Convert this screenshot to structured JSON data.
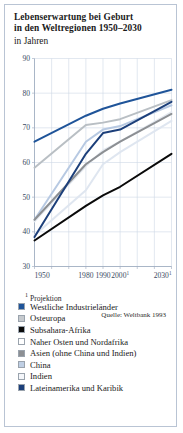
{
  "title": {
    "line1": "Lebenserwartung bei Geburt",
    "line2": "in den Weltregionen 1950–2030",
    "line3": "in Jahren"
  },
  "footnote": {
    "marker": "1",
    "text": "Projektion"
  },
  "source": "Quelle: Weltbank 1993",
  "chart_data": {
    "type": "line",
    "title": "Lebenserwartung bei Geburt in den Weltregionen 1950–2030",
    "subtitle": "in Jahren",
    "xlabel": "",
    "ylabel": "in Jahren",
    "ylim": [
      30,
      90
    ],
    "yticks": [
      30,
      40,
      50,
      60,
      70,
      80,
      90
    ],
    "ytick_labels": [
      "30",
      "40",
      "50",
      "60",
      "70",
      "80",
      "90"
    ],
    "x": [
      1950,
      1980,
      1990,
      2000,
      2030
    ],
    "xtick_labels": [
      "1950",
      "1980",
      "1990",
      "2000¹",
      "2030¹"
    ],
    "xlim": [
      1950,
      2030
    ],
    "grid": true,
    "legend_position": "below",
    "series": [
      {
        "name": "Westliche Industrieländer",
        "color": "#1f5499",
        "swatch": "#1f5499",
        "values": [
          66.0,
          73.5,
          75.5,
          77.0,
          81.0
        ]
      },
      {
        "name": "Osteuropa",
        "color": "#b9bfc4",
        "swatch": "#c6cace",
        "values": [
          58.5,
          70.8,
          71.5,
          72.5,
          78.0
        ]
      },
      {
        "name": "Subsahara-Afrika",
        "color": "#0a0a0a",
        "swatch": "#0a0a0a",
        "values": [
          37.5,
          47.5,
          50.5,
          53.0,
          62.5
        ]
      },
      {
        "name": "Naher Osten und Nordafrika",
        "color": "#e3e8ef",
        "swatch": "#ffffff",
        "values": [
          43.0,
          59.0,
          63.5,
          66.0,
          74.5
        ]
      },
      {
        "name": "Asien (ohne China und Indien)",
        "color": "#8c8f93",
        "swatch": "#8c8f93",
        "values": [
          43.5,
          59.5,
          63.0,
          66.0,
          74.0
        ]
      },
      {
        "name": "China",
        "color": "#b7c9e2",
        "swatch": "#bfcfe4",
        "values": [
          43.5,
          66.0,
          69.5,
          70.5,
          76.5
        ]
      },
      {
        "name": "Indien",
        "color": "#dfe6f0",
        "swatch": "#f4f6fa",
        "values": [
          39.0,
          52.0,
          59.5,
          63.0,
          72.0
        ]
      },
      {
        "name": "Lateinamerika und Karibik",
        "color": "#1c3f7a",
        "swatch": "#1c3f7a",
        "values": [
          38.5,
          62.5,
          68.5,
          69.5,
          77.5
        ]
      }
    ]
  }
}
